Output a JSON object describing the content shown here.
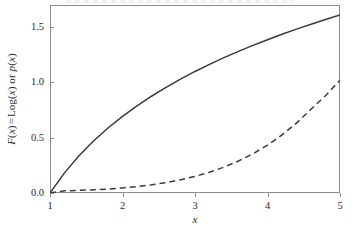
{
  "figure": {
    "background_color": "#ffffff",
    "frame_color": "#8d8d8d",
    "line_color": "#3a3a3a"
  },
  "axes": {
    "x_label": "x",
    "y_label_parts": {
      "f": "F",
      "open1": "(",
      "var1": "x",
      "close1": ")",
      "equals": "=",
      "log": "Log",
      "open2": "(",
      "var2": "x",
      "close2": ")",
      "or": "or",
      "p": "p",
      "open3": "(",
      "var3": "x",
      "close3": ")"
    },
    "y_label_plain": "F(x) = Log(x) or p(x)",
    "x_ticks": [
      "1",
      "2",
      "3",
      "4",
      "5"
    ],
    "y_ticks": [
      "0.0",
      "0.5",
      "1.0",
      "1.5"
    ]
  },
  "chart_data": {
    "type": "line",
    "title": "",
    "xlabel": "x",
    "ylabel": "F(x) = Log(x) or p(x)",
    "xlim": [
      1,
      5
    ],
    "ylim": [
      0,
      1.7
    ],
    "xticks": [
      1,
      2,
      3,
      4,
      5
    ],
    "yticks": [
      0.0,
      0.5,
      1.0,
      1.5
    ],
    "grid": false,
    "legend": "none",
    "series": [
      {
        "name": "F(x) = Log(x)",
        "style": "solid",
        "color": "#3a3a3a",
        "x": [
          1.0,
          1.2,
          1.4,
          1.6,
          1.8,
          2.0,
          2.2,
          2.4,
          2.6,
          2.8,
          3.0,
          3.2,
          3.4,
          3.6,
          3.8,
          4.0,
          4.2,
          4.4,
          4.6,
          4.8,
          5.0
        ],
        "values": [
          0.0,
          0.182,
          0.336,
          0.47,
          0.588,
          0.693,
          0.788,
          0.875,
          0.956,
          1.03,
          1.099,
          1.163,
          1.224,
          1.281,
          1.335,
          1.386,
          1.435,
          1.482,
          1.526,
          1.569,
          1.609
        ]
      },
      {
        "name": "p(x)",
        "style": "dashed",
        "color": "#3a3a3a",
        "x": [
          1.0,
          1.2,
          1.4,
          1.6,
          1.8,
          2.0,
          2.2,
          2.4,
          2.6,
          2.8,
          3.0,
          3.2,
          3.4,
          3.6,
          3.8,
          4.0,
          4.2,
          4.4,
          4.6,
          4.8,
          5.0
        ],
        "values": [
          0.0,
          0.02,
          0.024,
          0.029,
          0.036,
          0.046,
          0.058,
          0.074,
          0.094,
          0.119,
          0.15,
          0.188,
          0.234,
          0.289,
          0.355,
          0.433,
          0.525,
          0.632,
          0.757,
          0.88,
          1.02
        ]
      }
    ]
  }
}
